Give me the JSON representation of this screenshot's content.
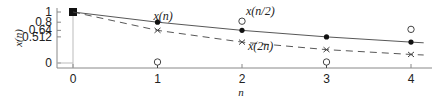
{
  "chart_data": {
    "type": "line",
    "title": "",
    "xlabel": "n",
    "ylabel": "x(n)",
    "x": [
      0,
      1,
      2,
      3,
      4
    ],
    "xticks": [
      "0",
      "1",
      "2",
      "3",
      "4"
    ],
    "yticks": [
      "0",
      "0.512",
      "0.64",
      "0.8",
      "1"
    ],
    "ytick_values": [
      0,
      0.512,
      0.64,
      0.8,
      1
    ],
    "ylim": [
      0,
      1
    ],
    "xlim": [
      -0.2,
      4.2
    ],
    "grid": false,
    "series": [
      {
        "name": "x(n)",
        "style": "solid",
        "marker": "filled-circle",
        "x": [
          0,
          1,
          2,
          3,
          4
        ],
        "values": [
          1,
          0.8,
          0.64,
          0.512,
          0.4096
        ]
      },
      {
        "name": "x(2n)",
        "style": "dashed",
        "marker": "x",
        "x": [
          0,
          1,
          2,
          3,
          4
        ],
        "values": [
          1,
          0.64,
          0.4096,
          0.2621,
          0.1678
        ]
      },
      {
        "name": "x(n/2)",
        "style": "none",
        "marker": "open-circle",
        "x": [
          0,
          1,
          2,
          3,
          4
        ],
        "values": [
          1,
          0,
          0.8,
          0,
          0.64
        ]
      }
    ],
    "annotations": [
      {
        "text": "x(n)",
        "near": [
          1,
          0.8
        ]
      },
      {
        "text": "x(n/2)",
        "near": [
          2,
          0.8
        ]
      },
      {
        "text": "x(2n)",
        "near": [
          2,
          0.4096
        ]
      }
    ]
  }
}
